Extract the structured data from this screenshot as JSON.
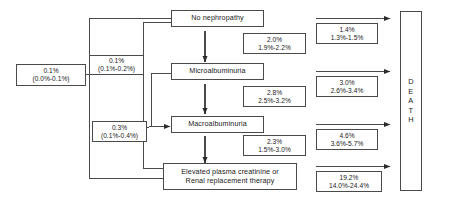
{
  "diagram": {
    "type": "flow-diagram",
    "line_color": "#4a4a4a",
    "text_color": "#1a1a1a",
    "background": "#ffffff"
  },
  "stages": [
    {
      "id": "no-nephropathy",
      "label": "No nephropathy"
    },
    {
      "id": "microalbuminuria",
      "label": "Microalbuminuria"
    },
    {
      "id": "macroalbuminuria",
      "label": "Macroalbuminuria"
    },
    {
      "id": "renal-failure",
      "line1": "Elevated plasma creatinine or",
      "line2": "Renal replacement therapy"
    }
  ],
  "terminal": {
    "id": "death",
    "letters": [
      "D",
      "E",
      "A",
      "T",
      "H"
    ],
    "label": "DEATH"
  },
  "left_rates": [
    {
      "id": "left-rate-1",
      "rate": "0.1%",
      "ci": "(0.0%-0.1%)"
    },
    {
      "id": "left-rate-2",
      "rate": "0.1%",
      "ci": "(0.1%-0.2%)"
    },
    {
      "id": "left-rate-3",
      "rate": "0.3%",
      "ci": "(0.1%-0.4%)"
    }
  ],
  "progression_rates": [
    {
      "id": "prog-rate-1",
      "from": "No nephropathy",
      "to": "Microalbuminuria",
      "rate": "2.0%",
      "ci": "1.9%-2.2%"
    },
    {
      "id": "prog-rate-2",
      "from": "Microalbuminuria",
      "to": "Macroalbuminuria",
      "rate": "2.8%",
      "ci": "2.5%-3.2%"
    },
    {
      "id": "prog-rate-3",
      "from": "Macroalbuminuria",
      "to": "Renal failure",
      "rate": "2.3%",
      "ci": "1.5%-3.0%"
    }
  ],
  "death_rates": [
    {
      "id": "death-rate-1",
      "from": "No nephropathy",
      "rate": "1.4%",
      "ci": "1.3%-1.5%"
    },
    {
      "id": "death-rate-2",
      "from": "Microalbuminuria",
      "rate": "3.0%",
      "ci": "2.6%-3.4%"
    },
    {
      "id": "death-rate-3",
      "from": "Macroalbuminuria",
      "rate": "4.6%",
      "ci": "3.6%-5.7%"
    },
    {
      "id": "death-rate-4",
      "from": "Renal failure",
      "rate": "19.2%",
      "ci": "14.0%-24.4%"
    }
  ]
}
